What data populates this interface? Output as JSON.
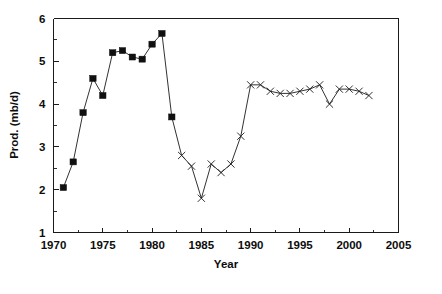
{
  "chart_data": {
    "type": "line",
    "title": "",
    "xlabel": "Year",
    "ylabel": "Prod. (mb/d)",
    "xlim": [
      1970,
      2005
    ],
    "ylim": [
      1,
      6
    ],
    "grid": false,
    "legend": "none",
    "x_ticks_major": [
      1970,
      1975,
      1980,
      1985,
      1990,
      1995,
      2000,
      2005
    ],
    "x_tick_labels": [
      "1970",
      "1975",
      "1980",
      "1985",
      "1990",
      "1995",
      "2000",
      "2005"
    ],
    "x_ticks_minor": [
      1972.5,
      1977.5,
      1982.5,
      1987.5,
      1992.5,
      1997.5,
      2002.5
    ],
    "y_ticks_major": [
      1,
      2,
      3,
      4,
      5,
      6
    ],
    "y_tick_labels": [
      "1",
      "2",
      "3",
      "4",
      "5",
      "6"
    ],
    "y_ticks_minor": [
      1.5,
      2.5,
      3.5,
      4.5,
      5.5
    ],
    "series": [
      {
        "name": "Production (filled square segment)",
        "marker": "filled-square",
        "x": [
          1971,
          1972,
          1973,
          1974,
          1975,
          1976,
          1977,
          1978,
          1979,
          1980,
          1981,
          1982
        ],
        "values": [
          2.05,
          2.65,
          3.8,
          4.6,
          4.2,
          5.2,
          5.25,
          5.1,
          5.05,
          5.4,
          5.65,
          3.7
        ]
      },
      {
        "name": "Production (x-marker segment)",
        "marker": "x-cross",
        "x": [
          1983,
          1984,
          1985,
          1986,
          1987,
          1988,
          1989,
          1990,
          1991,
          1992,
          1993,
          1994,
          1995,
          1996,
          1997,
          1998,
          1999,
          2000,
          2001,
          2002
        ],
        "values": [
          2.8,
          2.55,
          1.8,
          2.6,
          2.4,
          2.6,
          3.25,
          4.45,
          4.45,
          4.3,
          4.25,
          4.25,
          4.3,
          4.35,
          4.45,
          4.0,
          4.35,
          4.35,
          4.3,
          4.2
        ]
      }
    ]
  },
  "axes": {
    "x_axis_label": "Year",
    "y_axis_label": "Prod. (mb/d)"
  }
}
